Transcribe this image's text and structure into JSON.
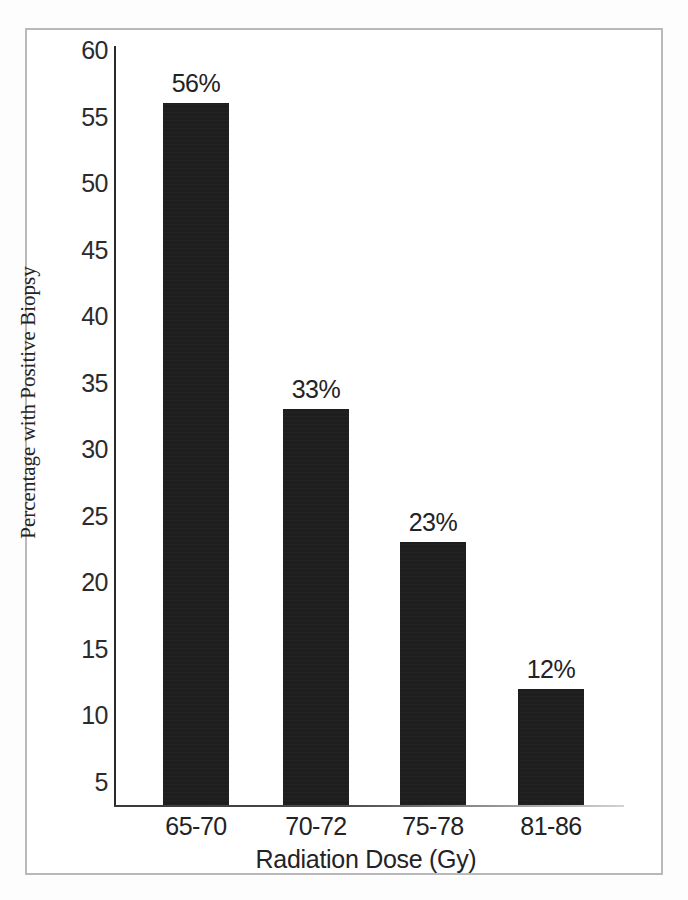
{
  "figure": {
    "background_color": "#ffffff",
    "frame_color": "#b9b9bb",
    "bar_color": "#1c1c1c",
    "axis_color": "#2a2a2c",
    "text_color": "#232325"
  },
  "chart_data": {
    "type": "bar",
    "title": "",
    "xlabel": "Radiation Dose (Gy)",
    "ylabel": "Percentage with Positive Biopsy",
    "categories": [
      "65-70",
      "70-72",
      "75-78",
      "81-86"
    ],
    "values": [
      56,
      33,
      23,
      12
    ],
    "data_labels": [
      "56%",
      "33%",
      "23%",
      "12%"
    ],
    "ylim": [
      3,
      60
    ],
    "yticks": [
      60,
      55,
      50,
      45,
      40,
      35,
      30,
      25,
      20,
      15,
      10,
      5
    ],
    "ytick_labels": [
      "60",
      "55",
      "50",
      "45",
      "40",
      "35",
      "30",
      "25",
      "20",
      "15",
      "10",
      "5"
    ],
    "grid": false,
    "legend": false,
    "legend_position": "none",
    "series": [
      {
        "name": "Percentage with Positive Biopsy",
        "values": [
          56,
          33,
          23,
          12
        ]
      }
    ]
  }
}
